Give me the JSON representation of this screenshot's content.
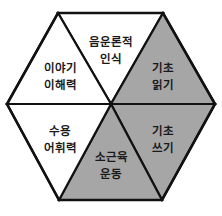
{
  "diagram": {
    "type": "hexagon-segments",
    "colors": {
      "filled": "#a6a6a6",
      "empty": "#ffffff",
      "stroke": "#111111",
      "text": "#1a1a1a"
    },
    "segments": [
      {
        "id": "top",
        "line1": "음운론적",
        "line2": "인식",
        "filled": false
      },
      {
        "id": "upper-right",
        "line1": "기초",
        "line2": "읽기",
        "filled": true
      },
      {
        "id": "lower-right",
        "line1": "기초",
        "line2": "쓰기",
        "filled": true
      },
      {
        "id": "bottom",
        "line1": "소근육",
        "line2": "운동",
        "filled": true
      },
      {
        "id": "lower-left",
        "line1": "수용",
        "line2": "어휘력",
        "filled": false
      },
      {
        "id": "upper-left",
        "line1": "이야기",
        "line2": "이해력",
        "filled": false
      }
    ]
  }
}
